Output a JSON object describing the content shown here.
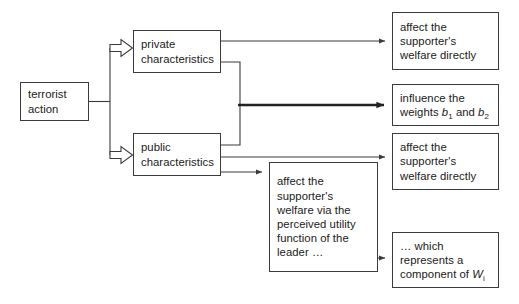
{
  "diagram": {
    "background_color": "#ffffff",
    "line_color": "#3b3b3b",
    "emphasis_line_color": "#222222",
    "nodes": [
      {
        "id": "terrorist-action",
        "label": "terrorist\naction",
        "x": 20,
        "y": 82,
        "w": 69,
        "h": 39
      },
      {
        "id": "private-characteristics",
        "label": "private\ncharacteristics",
        "x": 133,
        "y": 30,
        "w": 88,
        "h": 43
      },
      {
        "id": "public-characteristics",
        "label": "public\ncharacteristics",
        "x": 133,
        "y": 133,
        "w": 88,
        "h": 43
      },
      {
        "id": "affect-welfare-directly-top",
        "label": "affect the\nsupporter's\nwelfare directly",
        "x": 392,
        "y": 12,
        "w": 107,
        "h": 58
      },
      {
        "id": "influence-weights",
        "label_html": "influence the\nweights <i>b</i><sub>1</sub> and <i>b</i><sub>2</sub>",
        "label": "influence the weights b1 and b2",
        "x": 392,
        "y": 84,
        "w": 107,
        "h": 42
      },
      {
        "id": "affect-welfare-directly-bottom",
        "label": "affect the\nsupporter's\nwelfare directly",
        "x": 392,
        "y": 133,
        "w": 107,
        "h": 57
      },
      {
        "id": "affect-welfare-via-utility",
        "label": "affect the\nsupporter's\nwelfare via the\nperceived utility\nfunction of the\nleader …",
        "x": 269,
        "y": 162,
        "w": 109,
        "h": 110
      },
      {
        "id": "component-of-w",
        "label_html": "… which\nrepresents a\ncomponent of <i>W</i><sub>i</sub>",
        "label": "… which represents a component of Wi",
        "x": 392,
        "y": 232,
        "w": 107,
        "h": 56
      }
    ],
    "edges": [
      {
        "id": "terrorist-to-private",
        "from": "terrorist-action",
        "to": "private-characteristics",
        "style": "hollow-block-arrow"
      },
      {
        "id": "terrorist-to-public",
        "from": "terrorist-action",
        "to": "public-characteristics",
        "style": "hollow-block-arrow"
      },
      {
        "id": "private-to-affect-top",
        "from": "private-characteristics",
        "to": "affect-welfare-directly-top",
        "style": "thin-arrow"
      },
      {
        "id": "private-to-influence-weights",
        "from": "private-characteristics",
        "to": "influence-weights",
        "style": "thick-arrow"
      },
      {
        "id": "public-to-influence-weights",
        "from": "public-characteristics",
        "to": "influence-weights",
        "style": "thick-arrow"
      },
      {
        "id": "public-to-affect-bottom",
        "from": "public-characteristics",
        "to": "affect-welfare-directly-bottom",
        "style": "thin-arrow"
      },
      {
        "id": "public-to-via-utility",
        "from": "public-characteristics",
        "to": "affect-welfare-via-utility",
        "style": "thin-arrow"
      },
      {
        "id": "via-utility-to-component",
        "from": "affect-welfare-via-utility",
        "to": "component-of-w",
        "style": "thin-arrow"
      }
    ]
  }
}
